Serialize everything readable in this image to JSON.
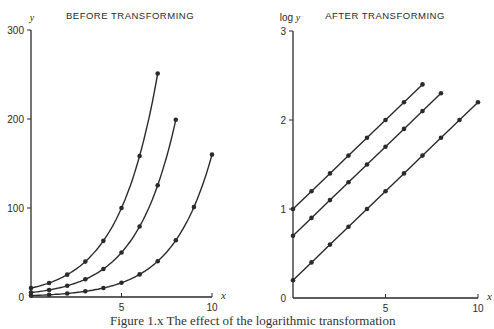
{
  "figure": {
    "caption": "Figure 1.x  The effect of the logarithmic transformation"
  },
  "chart_data": [
    {
      "type": "line",
      "title": "BEFORE TRANSFORMING",
      "xlabel": "x",
      "ylabel": "y",
      "xlim": [
        0,
        10
      ],
      "ylim": [
        0,
        300
      ],
      "xticks": [
        5,
        10
      ],
      "yticks": [
        0,
        100,
        200,
        300
      ],
      "grid": false,
      "legend": null,
      "series": [
        {
          "name": "series-a",
          "x": [
            0,
            1,
            2,
            3,
            4,
            5,
            6,
            7
          ],
          "values": [
            10,
            15.8,
            25.1,
            39.8,
            63.1,
            100,
            158.5,
            251.2
          ]
        },
        {
          "name": "series-b",
          "x": [
            0,
            1,
            2,
            3,
            4,
            5,
            6,
            7,
            8
          ],
          "values": [
            5,
            7.9,
            12.6,
            19.9,
            31.5,
            50,
            79.2,
            125.6,
            199.1
          ]
        },
        {
          "name": "series-c",
          "x": [
            0,
            1,
            2,
            3,
            4,
            5,
            6,
            7,
            8,
            9,
            10
          ],
          "values": [
            1.6,
            2.5,
            4.0,
            6.4,
            10.1,
            16,
            25.4,
            40.2,
            63.7,
            101,
            160
          ]
        }
      ]
    },
    {
      "type": "line",
      "title": "AFTER TRANSFORMING",
      "xlabel": "x",
      "ylabel": "log y",
      "xlim": [
        0,
        10
      ],
      "ylim": [
        0,
        3
      ],
      "xticks": [
        5,
        10
      ],
      "yticks": [
        0,
        1,
        2,
        3
      ],
      "grid": false,
      "legend": null,
      "series": [
        {
          "name": "series-a",
          "x": [
            0,
            1,
            2,
            3,
            4,
            5,
            6,
            7
          ],
          "values": [
            1.0,
            1.2,
            1.4,
            1.6,
            1.8,
            2.0,
            2.2,
            2.4
          ]
        },
        {
          "name": "series-b",
          "x": [
            0,
            1,
            2,
            3,
            4,
            5,
            6,
            7,
            8
          ],
          "values": [
            0.7,
            0.9,
            1.1,
            1.3,
            1.5,
            1.7,
            1.9,
            2.1,
            2.3
          ]
        },
        {
          "name": "series-c",
          "x": [
            0,
            1,
            2,
            3,
            4,
            5,
            6,
            7,
            8,
            9,
            10
          ],
          "values": [
            0.2,
            0.4,
            0.6,
            0.8,
            1.0,
            1.2,
            1.4,
            1.6,
            1.8,
            2.0,
            2.2
          ]
        }
      ]
    }
  ]
}
